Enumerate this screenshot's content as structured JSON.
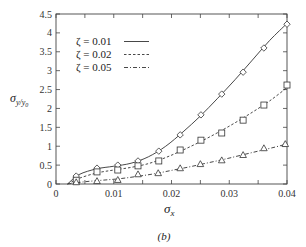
{
  "chart_data": {
    "type": "line",
    "title": "",
    "caption": "(b)",
    "xlabel": "σx",
    "ylabel": "σy/y0",
    "xlim": [
      0,
      0.04
    ],
    "ylim": [
      0,
      4.5
    ],
    "grid": false,
    "legend_position": "upper-left",
    "x_ticks": [
      0,
      0.01,
      0.02,
      0.03,
      0.04
    ],
    "x_tick_labels": [
      "0",
      "0.01",
      "0.02",
      "0.03",
      "0.04"
    ],
    "y_ticks": [
      0,
      0.5,
      1,
      1.5,
      2,
      2.5,
      3,
      3.5,
      4,
      4.5
    ],
    "y_tick_labels": [
      "0",
      "0.5",
      "1",
      "1.5",
      "2",
      "2.5",
      "3",
      "3.5",
      "4",
      "4.5"
    ],
    "series": [
      {
        "name": "ζ=0.01",
        "line_style": "solid",
        "marker": "diamond",
        "points": [
          [
            0.0035,
            0.21
          ],
          [
            0.0071,
            0.42
          ],
          [
            0.0107,
            0.5
          ],
          [
            0.0142,
            0.61
          ],
          [
            0.0178,
            0.87
          ],
          [
            0.0215,
            1.3
          ],
          [
            0.0251,
            1.83
          ],
          [
            0.0287,
            2.38
          ],
          [
            0.0324,
            2.96
          ],
          [
            0.036,
            3.6
          ],
          [
            0.04,
            4.23
          ]
        ],
        "curve": [
          [
            0.002,
            0.0
          ],
          [
            0.004,
            0.25
          ],
          [
            0.007,
            0.4
          ],
          [
            0.01,
            0.47
          ],
          [
            0.013,
            0.55
          ],
          [
            0.016,
            0.72
          ],
          [
            0.019,
            1.0
          ],
          [
            0.022,
            1.38
          ],
          [
            0.025,
            1.8
          ],
          [
            0.028,
            2.27
          ],
          [
            0.031,
            2.76
          ],
          [
            0.034,
            3.28
          ],
          [
            0.037,
            3.8
          ],
          [
            0.04,
            4.25
          ]
        ]
      },
      {
        "name": "ζ=0.02",
        "line_style": "dashed",
        "marker": "square",
        "points": [
          [
            0.0035,
            0.1
          ],
          [
            0.0071,
            0.32
          ],
          [
            0.0107,
            0.37
          ],
          [
            0.0142,
            0.48
          ],
          [
            0.0178,
            0.61
          ],
          [
            0.0215,
            0.9
          ],
          [
            0.0251,
            1.16
          ],
          [
            0.0287,
            1.35
          ],
          [
            0.0324,
            1.69
          ],
          [
            0.036,
            2.09
          ],
          [
            0.04,
            2.62
          ]
        ],
        "curve": [
          [
            0.002,
            0.0
          ],
          [
            0.004,
            0.15
          ],
          [
            0.007,
            0.29
          ],
          [
            0.01,
            0.37
          ],
          [
            0.013,
            0.44
          ],
          [
            0.016,
            0.54
          ],
          [
            0.019,
            0.7
          ],
          [
            0.022,
            0.9
          ],
          [
            0.025,
            1.12
          ],
          [
            0.028,
            1.36
          ],
          [
            0.031,
            1.62
          ],
          [
            0.034,
            1.9
          ],
          [
            0.037,
            2.2
          ],
          [
            0.04,
            2.55
          ]
        ]
      },
      {
        "name": "ζ=0.05",
        "line_style": "dash-dot",
        "marker": "triangle",
        "points": [
          [
            0.0035,
            0.05
          ],
          [
            0.0071,
            0.08
          ],
          [
            0.0107,
            0.11
          ],
          [
            0.0142,
            0.26
          ],
          [
            0.0177,
            0.29
          ],
          [
            0.0215,
            0.42
          ],
          [
            0.025,
            0.53
          ],
          [
            0.0287,
            0.63
          ],
          [
            0.0324,
            0.77
          ],
          [
            0.036,
            0.95
          ],
          [
            0.0397,
            1.06
          ]
        ],
        "curve": [
          [
            0.002,
            0.0
          ],
          [
            0.005,
            0.06
          ],
          [
            0.008,
            0.1
          ],
          [
            0.011,
            0.14
          ],
          [
            0.014,
            0.2
          ],
          [
            0.017,
            0.27
          ],
          [
            0.02,
            0.36
          ],
          [
            0.023,
            0.45
          ],
          [
            0.026,
            0.55
          ],
          [
            0.029,
            0.65
          ],
          [
            0.032,
            0.76
          ],
          [
            0.035,
            0.87
          ],
          [
            0.038,
            0.98
          ],
          [
            0.04,
            1.06
          ]
        ]
      }
    ]
  },
  "legend": {
    "items": [
      {
        "label": "ζ = 0.01",
        "style": "solid"
      },
      {
        "label": "ζ = 0.02",
        "style": "dashed"
      },
      {
        "label": "ζ = 0.05",
        "style": "dash-dot"
      }
    ]
  },
  "axes": {
    "xlabel_main": "σ",
    "xlabel_sub": "x",
    "ylabel_main": "σ",
    "ylabel_sub": "y/y",
    "ylabel_subsub": "0"
  },
  "caption": "(b)",
  "colors": {
    "line": "#333333",
    "axis": "#444444",
    "background": "#ffffff"
  }
}
